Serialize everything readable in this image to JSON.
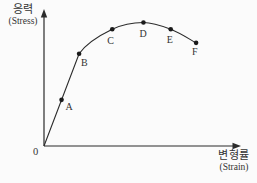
{
  "figure": {
    "background": "#fbfbfb",
    "line_color": "#2b2b2b",
    "dot_color": "#1a1a1a",
    "text_color": "#333333"
  },
  "axes": {
    "y_label_ko": "응력",
    "y_label_en": "(Stress)",
    "x_label_ko": "변형률",
    "x_label_en": "(Strain)",
    "origin_label": "0"
  },
  "chart_data": {
    "type": "line",
    "xlabel": "변형률 (Strain)",
    "ylabel": "응력 (Stress)",
    "xlim": [
      0,
      100
    ],
    "ylim": [
      0,
      100
    ],
    "grid": false,
    "legend": false,
    "curve_shape": "straight elastic segment from origin through A to B, then smooth curve rising through C to peak at D and falling through E to F",
    "origin": {
      "x": 0,
      "y": 0
    },
    "points": [
      {
        "label": "A",
        "x": 9,
        "y": 34
      },
      {
        "label": "B",
        "x": 18,
        "y": 68
      },
      {
        "label": "C",
        "x": 35,
        "y": 86
      },
      {
        "label": "D",
        "x": 51,
        "y": 91
      },
      {
        "label": "E",
        "x": 65,
        "y": 86
      },
      {
        "label": "F",
        "x": 78,
        "y": 76
      }
    ]
  }
}
